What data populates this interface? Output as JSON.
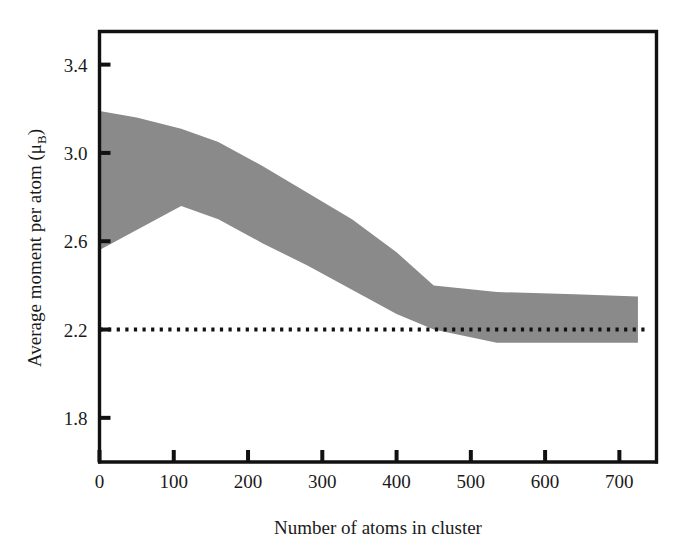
{
  "chart_data": {
    "type": "area",
    "title": "",
    "xlabel": "Number of atoms in cluster",
    "ylabel_main": "Average moment per atom (μ",
    "ylabel_sub": "B",
    "ylabel_close": ")",
    "ylabel_full": "Average moment per atom (μB)",
    "xlim": [
      0,
      750
    ],
    "ylim": [
      1.6,
      3.55
    ],
    "xticks": [
      0,
      100,
      200,
      300,
      400,
      500,
      600,
      700
    ],
    "xtick_labels": [
      "0",
      "100",
      "200",
      "300",
      "400",
      "500",
      "600",
      "700"
    ],
    "yticks": [
      1.8,
      2.2,
      2.6,
      3.0,
      3.4
    ],
    "ytick_labels": [
      "1.8",
      "2.2",
      "2.6",
      "3.0",
      "3.4"
    ],
    "grid": false,
    "legend": "none",
    "band_color": "#8a8a8a",
    "axis_color": "#111111",
    "series": [
      {
        "name": "upper bound",
        "x": [
          0,
          50,
          110,
          160,
          220,
          280,
          340,
          400,
          450,
          535,
          640,
          725
        ],
        "values": [
          3.19,
          3.16,
          3.11,
          3.05,
          2.94,
          2.82,
          2.7,
          2.55,
          2.4,
          2.37,
          2.36,
          2.35
        ]
      },
      {
        "name": "lower bound",
        "x": [
          0,
          110,
          160,
          220,
          280,
          340,
          400,
          450,
          535,
          640,
          725
        ],
        "values": [
          2.56,
          2.76,
          2.7,
          2.59,
          2.49,
          2.38,
          2.27,
          2.2,
          2.14,
          2.14,
          2.14
        ]
      }
    ],
    "reference_line": {
      "name": "bulk value",
      "y": 2.2,
      "style": "dotted",
      "x_start": 0,
      "x_end": 740
    }
  }
}
